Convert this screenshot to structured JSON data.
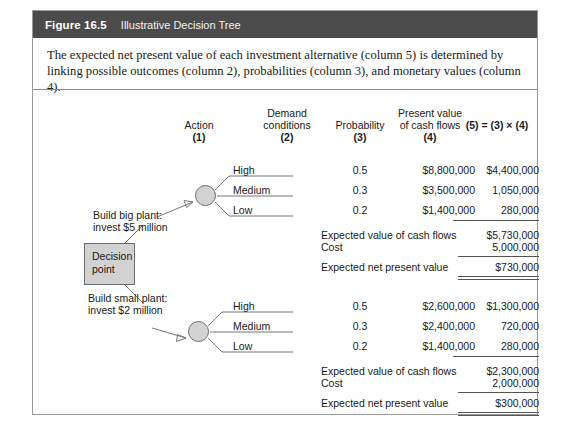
{
  "figure": {
    "number": "Figure 16.5",
    "title": "Illustrative Decision Tree",
    "caption": "The expected net present value of each investment alternative (column 5) is determined by linking possible outcomes (column 2), probabilities (column 3), and monetary values (column 4).",
    "header_bg": "#4b4b4b",
    "node_fill": "#d2d2d2"
  },
  "headers": {
    "col1_l1": "Action",
    "col1_l2": "(1)",
    "col2_l1": "Demand",
    "col2_l2": "conditions",
    "col2_l3": "(2)",
    "col3_l1": "Probability",
    "col3_l2": "(3)",
    "col4_l1": "Present value",
    "col4_l2": "of cash flows",
    "col4_l3": "(4)",
    "col5": "(5) = (3) × (4)"
  },
  "decision_point": {
    "line1": "Decision",
    "line2": "point"
  },
  "branches": [
    {
      "action_l1": "Build big plant:",
      "action_l2": "invest $5 million",
      "outcomes": [
        {
          "condition": "High",
          "probability": "0.5",
          "present_value": "$8,800,000",
          "expected": "$4,400,000"
        },
        {
          "condition": "Medium",
          "probability": "0.3",
          "present_value": "$3,500,000",
          "expected": "1,050,000"
        },
        {
          "condition": "Low",
          "probability": "0.2",
          "present_value": "$1,400,000",
          "expected": "280,000"
        }
      ],
      "summary": [
        {
          "label": "Expected value of cash flows",
          "value": "$5,730,000"
        },
        {
          "label": "Cost",
          "value": "5,000,000"
        },
        {
          "label": "Expected net present value",
          "value": "$730,000"
        }
      ]
    },
    {
      "action_l1": "Build small plant:",
      "action_l2": "invest $2 million",
      "outcomes": [
        {
          "condition": "High",
          "probability": "0.5",
          "present_value": "$2,600,000",
          "expected": "$1,300,000"
        },
        {
          "condition": "Medium",
          "probability": "0.3",
          "present_value": "$2,400,000",
          "expected": "720,000"
        },
        {
          "condition": "Low",
          "probability": "0.2",
          "present_value": "$1,400,000",
          "expected": "280,000"
        }
      ],
      "summary": [
        {
          "label": "Expected value of cash flows",
          "value": "$2,300,000"
        },
        {
          "label": "Cost",
          "value": "2,000,000"
        },
        {
          "label": "Expected net present value",
          "value": "$300,000"
        }
      ]
    }
  ]
}
